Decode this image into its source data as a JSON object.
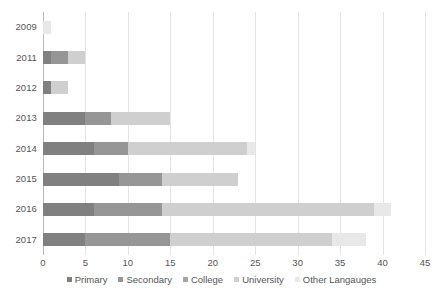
{
  "chart_data": {
    "type": "bar",
    "orientation": "horizontal",
    "stacked": true,
    "title": "",
    "xlabel": "",
    "ylabel": "",
    "categories": [
      "2009",
      "2011",
      "2012",
      "2013",
      "2014",
      "2015",
      "2016",
      "2017"
    ],
    "series": [
      {
        "name": "Primary",
        "color": "#808080",
        "values": [
          0,
          1,
          1,
          5,
          6,
          9,
          6,
          5
        ]
      },
      {
        "name": "Secondary",
        "color": "#969696",
        "values": [
          0,
          2,
          0,
          3,
          4,
          5,
          8,
          10
        ]
      },
      {
        "name": "College",
        "color": "#a6a6a6",
        "values": [
          0,
          0,
          0,
          0,
          0,
          0,
          0,
          0
        ]
      },
      {
        "name": "University",
        "color": "#cfcfcf",
        "values": [
          0,
          2,
          2,
          7,
          14,
          9,
          25,
          19
        ]
      },
      {
        "name": "Other Langauges",
        "color": "#e8e8e8",
        "values": [
          1,
          0,
          0,
          0,
          1,
          0,
          2,
          4
        ]
      }
    ],
    "totals": [
      1,
      5,
      3,
      15,
      25,
      23,
      41,
      38
    ],
    "xlim": [
      0,
      45
    ],
    "xticks": [
      0,
      5,
      10,
      15,
      20,
      25,
      30,
      35,
      40,
      45
    ],
    "xtick_labels": [
      "0",
      "5",
      "10",
      "15",
      "20",
      "25",
      "30",
      "35",
      "40",
      "45"
    ],
    "grid": "vertical",
    "legend_position": "bottom"
  },
  "axis": {
    "gridline_color": "#e4e4e4",
    "zero_axis_color": "#b9b9b9",
    "tick_label_color": "#555555"
  },
  "background": "#ffffff"
}
